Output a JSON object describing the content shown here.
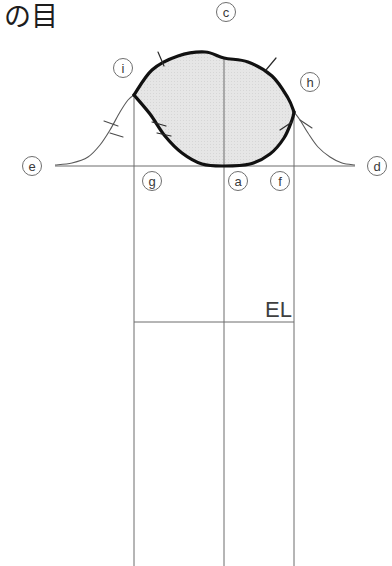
{
  "title": {
    "text": "の目"
  },
  "annotations": {
    "el_label": "EL"
  },
  "points": [
    {
      "id": "c",
      "label": "c",
      "cx": 226,
      "cy": 12
    },
    {
      "id": "i",
      "label": "i",
      "cx": 123,
      "cy": 68
    },
    {
      "id": "h",
      "label": "h",
      "cx": 310,
      "cy": 82
    },
    {
      "id": "e",
      "label": "e",
      "cx": 32,
      "cy": 166
    },
    {
      "id": "d",
      "label": "d",
      "cx": 377,
      "cy": 166
    },
    {
      "id": "g",
      "label": "g",
      "cx": 152,
      "cy": 181
    },
    {
      "id": "a",
      "label": "a",
      "cx": 238,
      "cy": 181
    },
    {
      "id": "f",
      "label": "f",
      "cx": 280,
      "cy": 181
    }
  ],
  "chart_data": {
    "type": "line",
    "title": "の目",
    "xlabel": "",
    "ylabel": "",
    "grid": false,
    "legend": "none",
    "baseline_y": 166,
    "axis_x_range": [
      55,
      355
    ],
    "vertical_lines": [
      {
        "name": "g-line",
        "x": 134,
        "y_top": 95,
        "y_bottom": 566
      },
      {
        "name": "a-line",
        "x": 224,
        "y_top": 58,
        "y_bottom": 566
      },
      {
        "name": "f-line",
        "x": 294,
        "y_top": 112,
        "y_bottom": 566
      }
    ],
    "horizontal_lines": [
      {
        "name": "axis-line",
        "x1": 55,
        "x2": 355,
        "y": 166
      },
      {
        "name": "el-line",
        "x1": 134,
        "x2": 294,
        "y": 322
      }
    ],
    "curves": [
      {
        "name": "left-tail",
        "style": "thin",
        "points": [
          [
            55,
            165
          ],
          [
            72,
            163
          ],
          [
            88,
            157
          ],
          [
            100,
            145
          ],
          [
            110,
            130
          ],
          [
            120,
            112
          ],
          [
            128,
            100
          ],
          [
            134,
            95
          ]
        ]
      },
      {
        "name": "right-tail",
        "style": "thin",
        "points": [
          [
            294,
            112
          ],
          [
            300,
            120
          ],
          [
            308,
            133
          ],
          [
            318,
            147
          ],
          [
            330,
            157
          ],
          [
            342,
            163
          ],
          [
            355,
            165
          ]
        ]
      },
      {
        "name": "eye-upper",
        "style": "thick",
        "points": [
          [
            134,
            95
          ],
          [
            152,
            70
          ],
          [
            178,
            56
          ],
          [
            205,
            52
          ],
          [
            224,
            58
          ],
          [
            248,
            62
          ],
          [
            272,
            76
          ],
          [
            288,
            98
          ],
          [
            294,
            112
          ]
        ]
      },
      {
        "name": "eye-lower",
        "style": "thick",
        "points": [
          [
            134,
            95
          ],
          [
            150,
            114
          ],
          [
            165,
            136
          ],
          [
            182,
            153
          ],
          [
            202,
            164
          ],
          [
            224,
            166
          ],
          [
            250,
            164
          ],
          [
            270,
            154
          ],
          [
            284,
            138
          ],
          [
            292,
            120
          ],
          [
            294,
            112
          ]
        ]
      }
    ],
    "tick_marks": [
      {
        "name": "upper-left-arc-tick",
        "x1": 158,
        "y1": 52,
        "x2": 164,
        "y2": 66
      },
      {
        "name": "upper-right-arc-tick",
        "x1": 276,
        "y1": 58,
        "x2": 266,
        "y2": 70
      },
      {
        "name": "inner-lower-left-tick-1",
        "x1": 152,
        "y1": 122,
        "x2": 166,
        "y2": 126
      },
      {
        "name": "inner-lower-left-tick-2",
        "x1": 157,
        "y1": 133,
        "x2": 171,
        "y2": 136
      },
      {
        "name": "inner-lower-right-tick",
        "x1": 292,
        "y1": 122,
        "x2": 280,
        "y2": 130
      },
      {
        "name": "left-tail-tick-1",
        "x1": 104,
        "y1": 121,
        "x2": 118,
        "y2": 126
      },
      {
        "name": "left-tail-tick-2",
        "x1": 110,
        "y1": 133,
        "x2": 123,
        "y2": 137
      },
      {
        "name": "right-tail-tick",
        "x1": 300,
        "y1": 120,
        "x2": 312,
        "y2": 128
      }
    ],
    "shaded_region": {
      "name": "eye-fill",
      "color": "#e3e3e3"
    }
  },
  "colors": {
    "background": "#ffffff",
    "thick_stroke": "#111111",
    "thin_stroke": "#6d6d6d",
    "fill": "#e3e3e3",
    "text": "#3a3a3a"
  }
}
